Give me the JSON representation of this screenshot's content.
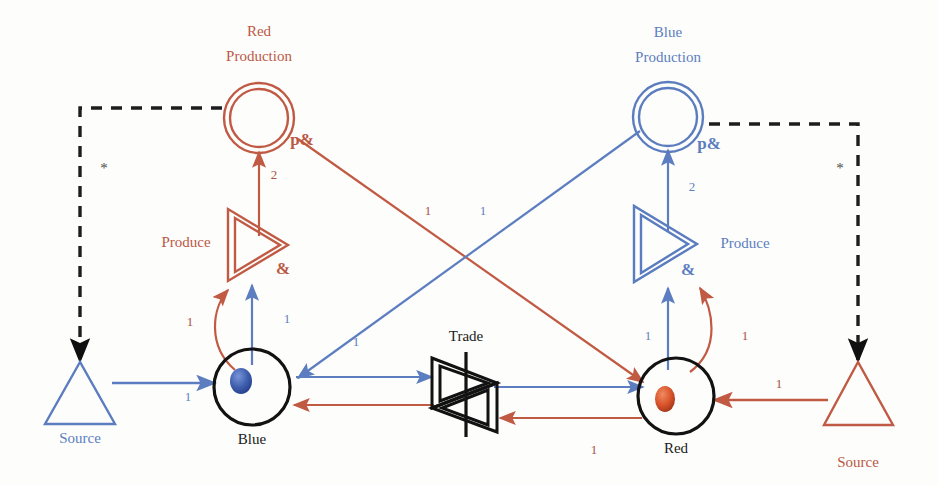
{
  "diagram": {
    "colors": {
      "red": "#c05a44",
      "blue": "#5b7dc0",
      "black": "#121212",
      "gray_label": "#55554f",
      "background": "#fdfdfc"
    },
    "nodes": [
      {
        "id": "red-production",
        "kind": "double-circle",
        "label": "Red\nProduction",
        "label_line1": "Red",
        "label_line2": "Production",
        "color": "red"
      },
      {
        "id": "blue-production",
        "kind": "double-circle",
        "label": "Blue\nProduction",
        "label_line1": "Blue",
        "label_line2": "Production",
        "color": "blue"
      },
      {
        "id": "produce-left",
        "kind": "double-triangle",
        "label": "Produce",
        "color": "red"
      },
      {
        "id": "produce-right",
        "kind": "double-triangle",
        "label": "Produce",
        "color": "blue"
      },
      {
        "id": "trade",
        "kind": "double-triangle-bar",
        "label": "Trade",
        "color": "black"
      },
      {
        "id": "place-blue",
        "kind": "circle-token",
        "label": "Blue",
        "color": "black",
        "token_color": "blue"
      },
      {
        "id": "place-red",
        "kind": "circle-token",
        "label": "Red",
        "color": "black",
        "token_color": "red"
      },
      {
        "id": "source-left",
        "kind": "triangle",
        "label": "Source",
        "color": "blue"
      },
      {
        "id": "source-right",
        "kind": "triangle",
        "label": "Source",
        "color": "red"
      }
    ],
    "annotations": {
      "p_and_left": "p&",
      "p_and_right": "p&",
      "amp_left": "&",
      "amp_right": "&",
      "star_left": "*",
      "star_right": "*"
    },
    "arc_labels": {
      "red_prod_weight": "2",
      "blue_prod_weight": "2",
      "red_cross": "1",
      "blue_cross": "1",
      "blue_to_trade": "1",
      "red_to_trade": "1",
      "left_produce_in_red": "1",
      "left_produce_in_blue": "1",
      "right_produce_in_blue": "1",
      "right_produce_in_red": "1",
      "source_left_to_blue": "1",
      "source_right_to_red": "1"
    }
  }
}
